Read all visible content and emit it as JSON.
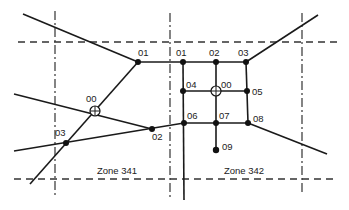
{
  "diagram": {
    "title": "",
    "zones": [
      {
        "label": "Zone 341"
      },
      {
        "label": "Zone 342"
      }
    ],
    "zone_341_nodes": {
      "centroid": "00",
      "n01": "01",
      "n02": "02",
      "n03": "03"
    },
    "zone_342_nodes": {
      "centroid": "00",
      "n01": "01",
      "n02": "02",
      "n03": "03",
      "n04": "04",
      "n05": "05",
      "n06": "06",
      "n07": "07",
      "n08": "08",
      "n09": "09"
    }
  }
}
